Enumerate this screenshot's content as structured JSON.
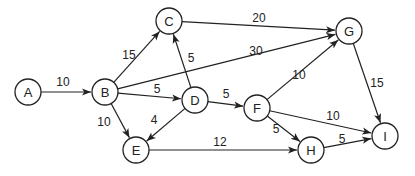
{
  "diagram": {
    "type": "directed-weighted-graph",
    "node_radius": 13,
    "nodes": [
      {
        "id": "A",
        "label": "A",
        "x": 28,
        "y": 92
      },
      {
        "id": "B",
        "label": "B",
        "x": 105,
        "y": 92
      },
      {
        "id": "C",
        "label": "C",
        "x": 169,
        "y": 21
      },
      {
        "id": "G",
        "label": "G",
        "x": 349,
        "y": 31
      },
      {
        "id": "D",
        "label": "D",
        "x": 195,
        "y": 100
      },
      {
        "id": "F",
        "label": "F",
        "x": 257,
        "y": 108
      },
      {
        "id": "E",
        "label": "E",
        "x": 136,
        "y": 150
      },
      {
        "id": "H",
        "label": "H",
        "x": 311,
        "y": 150
      },
      {
        "id": "I",
        "label": "I",
        "x": 385,
        "y": 136
      }
    ],
    "edges": [
      {
        "from": "A",
        "to": "B",
        "weight": "10",
        "lx": 63,
        "ly": 82
      },
      {
        "from": "B",
        "to": "C",
        "weight": "15",
        "lx": 129,
        "ly": 55
      },
      {
        "from": "B",
        "to": "G",
        "weight": "30",
        "lx": 256,
        "ly": 51
      },
      {
        "from": "B",
        "to": "D",
        "weight": "5",
        "lx": 157,
        "ly": 89
      },
      {
        "from": "B",
        "to": "E",
        "weight": "10",
        "lx": 104,
        "ly": 122
      },
      {
        "from": "D",
        "to": "C",
        "weight": "5",
        "lx": 191,
        "ly": 58
      },
      {
        "from": "C",
        "to": "G",
        "weight": "20",
        "lx": 259,
        "ly": 18
      },
      {
        "from": "D",
        "to": "E",
        "weight": "4",
        "lx": 154,
        "ly": 120
      },
      {
        "from": "D",
        "to": "F",
        "weight": "5",
        "lx": 226,
        "ly": 94
      },
      {
        "from": "F",
        "to": "G",
        "weight": "10",
        "lx": 299,
        "ly": 75
      },
      {
        "from": "G",
        "to": "I",
        "weight": "15",
        "lx": 377,
        "ly": 83
      },
      {
        "from": "F",
        "to": "I",
        "weight": "10",
        "lx": 333,
        "ly": 116
      },
      {
        "from": "F",
        "to": "H",
        "weight": "5",
        "lx": 276,
        "ly": 129
      },
      {
        "from": "E",
        "to": "H",
        "weight": "12",
        "lx": 220,
        "ly": 142
      },
      {
        "from": "H",
        "to": "I",
        "weight": "5",
        "lx": 342,
        "ly": 139
      }
    ]
  }
}
